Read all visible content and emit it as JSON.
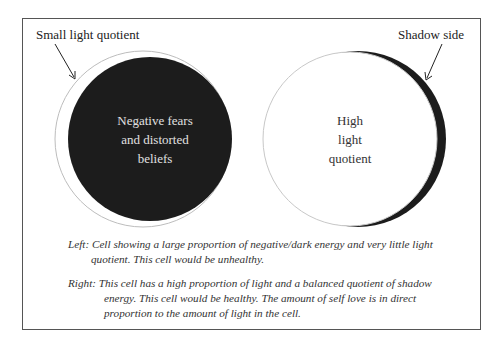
{
  "diagram": {
    "left_cell": {
      "callout": "Small light quotient",
      "inner_text": [
        "Negative fears",
        "and distorted",
        "beliefs"
      ],
      "dark_color": "#1c1c1c",
      "light_color": "#ffffff"
    },
    "right_cell": {
      "callout": "Shadow side",
      "inner_text": [
        "High",
        "light",
        "quotient"
      ],
      "dark_color": "#1c1c1c",
      "light_color": "#ffffff"
    },
    "captions": [
      {
        "key": "Left:",
        "line1": "Cell showing a large proportion of negative/dark energy and very little light",
        "line2": "quotient. This cell would be unhealthy."
      },
      {
        "key": "Right:",
        "line1": "This cell has a high proportion of light and a balanced quotient of shadow",
        "line2": "energy. This cell would be healthy. The amount of self love is in direct",
        "line3": "proportion to the amount of light in the cell."
      }
    ]
  }
}
